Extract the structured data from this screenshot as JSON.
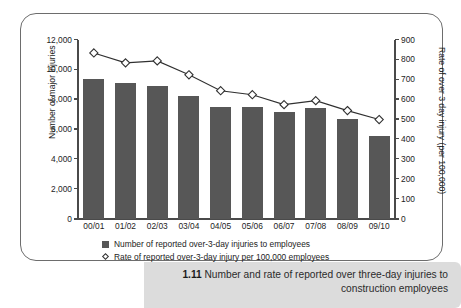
{
  "figure": {
    "caption_number": "1.11",
    "caption_text": "Number and rate of reported over three-day injuries to construction employees"
  },
  "colors": {
    "bar": "#575757",
    "line": "#303030",
    "marker_fill": "#ffffff",
    "frame": "#6d6d6d",
    "caption_band": "#dcdcdc",
    "axis": "#4a4a4a"
  },
  "legend": {
    "items": [
      {
        "marker": "filled-square",
        "label": "Number of reported over-3-day injuries to employees"
      },
      {
        "marker": "open-diamond",
        "label": "Rate of reported over-3-day injury per 100,000 employees"
      }
    ]
  },
  "chart_data": {
    "type": "bar",
    "title": "",
    "subtitle": "",
    "xlabel": "",
    "ylabel": "Number of major injuries",
    "y2label": "Rate of over 3 day injury (per 100,000)",
    "categories": [
      "00/01",
      "01/02",
      "02/03",
      "03/04",
      "04/05",
      "05/06",
      "06/07",
      "07/08",
      "08/09",
      "09/10"
    ],
    "ylim": [
      0,
      12000
    ],
    "y2lim": [
      0,
      900
    ],
    "yticks": [
      0,
      2000,
      4000,
      6000,
      8000,
      10000,
      12000
    ],
    "ytick_labels": [
      "0",
      "2,000",
      "4,000",
      "6,000",
      "8,000",
      "10,000",
      "12,000"
    ],
    "y2ticks": [
      0,
      100,
      200,
      300,
      400,
      500,
      600,
      700,
      800,
      900
    ],
    "y2tick_labels": [
      "0",
      "100",
      "200",
      "300",
      "400",
      "500",
      "600",
      "700",
      "800",
      "900"
    ],
    "grid": false,
    "legend_position": "bottom",
    "series": [
      {
        "name": "Number of reported over-3-day injuries to employees",
        "type": "bar",
        "axis": "left",
        "values": [
          9400,
          9100,
          8950,
          8250,
          7500,
          7500,
          7150,
          7450,
          6700,
          5550
        ]
      },
      {
        "name": "Rate of reported over-3-day injury per 100,000 employees",
        "type": "line",
        "axis": "right",
        "marker": "open-diamond",
        "values": [
          835,
          785,
          795,
          725,
          645,
          625,
          575,
          595,
          545,
          500
        ]
      }
    ]
  }
}
